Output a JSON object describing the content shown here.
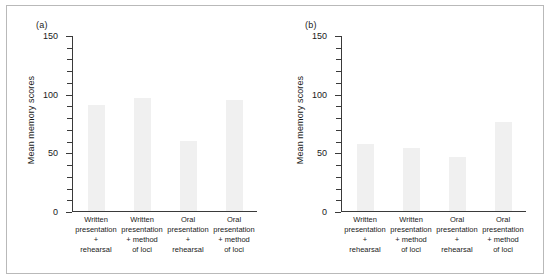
{
  "chart_data": [
    {
      "type": "bar",
      "panel": "(a)",
      "title": "",
      "xlabel": "",
      "ylabel": "Mean memory scores",
      "ylim": [
        0,
        150
      ],
      "yticks": [
        0,
        50,
        100,
        150
      ],
      "ytick_labels": [
        "0",
        "50",
        "100",
        "150"
      ],
      "minor_tick_step": 10,
      "grid": false,
      "legend": "none",
      "categories": [
        "Written presentation + rehearsal",
        "Written presentation + method of loci",
        "Oral presentation + rehearsal",
        "Oral presentation + method of loci"
      ],
      "category_lines": [
        [
          "Written",
          "presentation",
          "+",
          "rehearsal"
        ],
        [
          "Written",
          "presentation",
          "+ method",
          "of loci"
        ],
        [
          "Oral",
          "presentation",
          "+",
          "rehearsal"
        ],
        [
          "Oral",
          "presentation",
          "+ method",
          "of loci"
        ]
      ],
      "values": [
        90,
        96,
        60,
        95
      ],
      "bar_color": "#f0f0f0"
    },
    {
      "type": "bar",
      "panel": "(b)",
      "title": "",
      "xlabel": "",
      "ylabel": "Mean memory scores",
      "ylim": [
        0,
        150
      ],
      "yticks": [
        0,
        50,
        100,
        150
      ],
      "ytick_labels": [
        "0",
        "50",
        "100",
        "150"
      ],
      "minor_tick_step": 10,
      "grid": false,
      "legend": "none",
      "categories": [
        "Written presentation + rehearsal",
        "Written presentation + method of loci",
        "Oral presentation + rehearsal",
        "Oral presentation + method of loci"
      ],
      "category_lines": [
        [
          "Written",
          "presentation",
          "+",
          "rehearsal"
        ],
        [
          "Written",
          "presentation",
          "+ method",
          "of loci"
        ],
        [
          "Oral",
          "presentation",
          "+",
          "rehearsal"
        ],
        [
          "Oral",
          "presentation",
          "+ method",
          "of loci"
        ]
      ],
      "values": [
        57,
        54,
        46,
        76
      ],
      "bar_color": "#f0f0f0"
    }
  ],
  "colors": {
    "axis": "#3a3a3a",
    "text": "#1a1a1a",
    "frame": "#b9b9b9",
    "bar": "#f0f0f0",
    "background": "#ffffff"
  }
}
